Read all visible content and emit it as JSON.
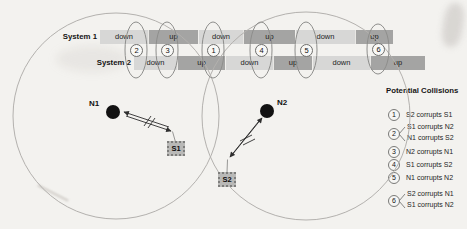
{
  "timeline": {
    "system1": {
      "label": "System 1",
      "segments": [
        {
          "state": "down"
        },
        {
          "state": "up"
        },
        {
          "state": "down"
        },
        {
          "state": "up"
        },
        {
          "state": "down"
        },
        {
          "state": "up"
        }
      ]
    },
    "system2": {
      "label": "System 2",
      "segments": [
        {
          "state": "down"
        },
        {
          "state": "up"
        },
        {
          "state": "down"
        },
        {
          "state": "up"
        },
        {
          "state": "down"
        },
        {
          "state": "up"
        }
      ]
    }
  },
  "markers": [
    {
      "number": "2"
    },
    {
      "number": "3"
    },
    {
      "number": "1"
    },
    {
      "number": "4"
    },
    {
      "number": "5"
    },
    {
      "number": "6"
    }
  ],
  "nodes": [
    {
      "label": "N1"
    },
    {
      "label": "N2"
    }
  ],
  "stations": [
    {
      "label": "S1"
    },
    {
      "label": "S2"
    }
  ],
  "legend": {
    "title": "Potential Collisions",
    "items": [
      {
        "number": "1",
        "lines": [
          "S2 corrupts S1"
        ]
      },
      {
        "number": "2",
        "lines": [
          "S1 corrupts N2",
          "N1 corrupts S2"
        ]
      },
      {
        "number": "3",
        "lines": [
          "N2 corrupts N1"
        ]
      },
      {
        "number": "4",
        "lines": [
          "S1 corrupts S2"
        ]
      },
      {
        "number": "5",
        "lines": [
          "N1 corrupts N2"
        ]
      },
      {
        "number": "6",
        "lines": [
          "S2 corrupts N1",
          "S1 corrupts N2"
        ]
      }
    ]
  },
  "colors": {
    "background": "#f3f2ef",
    "state_down_fill": "#d7d7d6",
    "state_up_fill": "#a4a4a3",
    "circle_stroke": "#b3b1ae",
    "ellipse_stroke": "#8e8e8c",
    "node_fill": "#121212",
    "station_fill": "#b9b9b7",
    "link_stroke": "#2e2e2e"
  }
}
